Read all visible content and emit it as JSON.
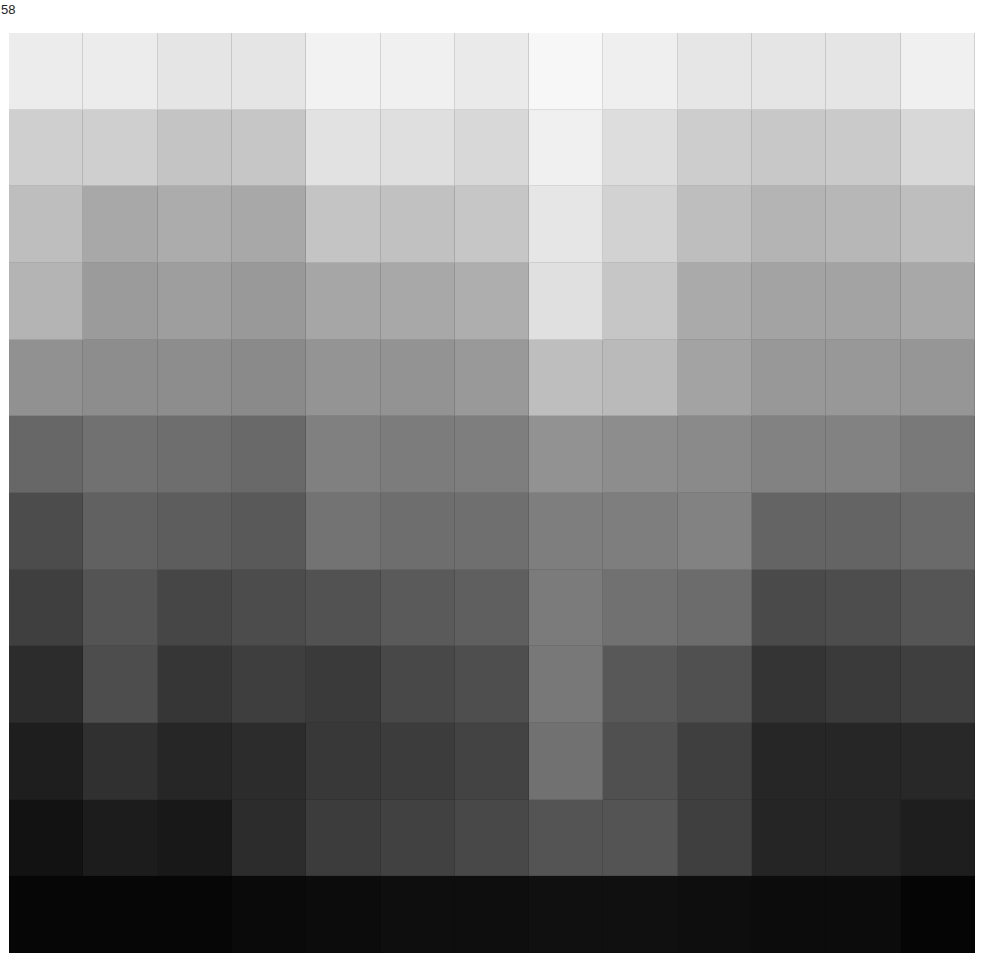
{
  "page": {
    "page_number": "58"
  },
  "grid": {
    "columns": 13,
    "rows": 12,
    "description": "grayscale value chart",
    "gray_values": [
      [
        236,
        236,
        229,
        229,
        242,
        240,
        234,
        247,
        239,
        230,
        229,
        229,
        240
      ],
      [
        207,
        207,
        196,
        198,
        226,
        223,
        216,
        240,
        221,
        205,
        200,
        202,
        216
      ],
      [
        190,
        168,
        172,
        168,
        196,
        193,
        198,
        230,
        210,
        190,
        180,
        183,
        190
      ],
      [
        180,
        155,
        158,
        153,
        166,
        168,
        174,
        224,
        198,
        170,
        163,
        163,
        168
      ],
      [
        145,
        141,
        141,
        138,
        148,
        147,
        153,
        190,
        186,
        163,
        152,
        152,
        150
      ],
      [
        103,
        113,
        110,
        105,
        128,
        124,
        126,
        146,
        141,
        138,
        130,
        130,
        121
      ],
      [
        76,
        97,
        93,
        89,
        115,
        110,
        111,
        126,
        126,
        130,
        100,
        100,
        106
      ],
      [
        63,
        84,
        70,
        76,
        82,
        90,
        95,
        123,
        113,
        108,
        74,
        77,
        85
      ],
      [
        44,
        77,
        54,
        62,
        58,
        72,
        78,
        120,
        88,
        80,
        52,
        58,
        63
      ],
      [
        30,
        48,
        38,
        44,
        56,
        60,
        67,
        113,
        80,
        63,
        38,
        38,
        40
      ],
      [
        18,
        28,
        24,
        44,
        60,
        65,
        72,
        84,
        84,
        63,
        37,
        37,
        30
      ],
      [
        6,
        6,
        6,
        10,
        12,
        14,
        14,
        16,
        16,
        14,
        12,
        12,
        5
      ]
    ]
  }
}
